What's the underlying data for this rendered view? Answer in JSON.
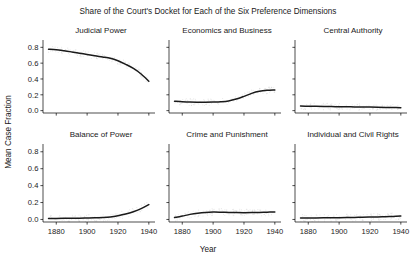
{
  "chart_data": {
    "type": "line",
    "title": "Share of the Court's Docket for Each of the Six Preference Dimensions",
    "xlabel": "Year",
    "ylabel": "Mean Case Fraction",
    "xlim": [
      1874,
      1944
    ],
    "ylim": [
      -0.03,
      0.88
    ],
    "xticks": [
      1880,
      1900,
      1920,
      1940
    ],
    "xticklabels": [
      "1880",
      "1900",
      "1920",
      "1940"
    ],
    "yticks": [
      0.0,
      0.2,
      0.4,
      0.6,
      0.8
    ],
    "yticklabels": [
      "0.0",
      "0.2",
      "0.4",
      "0.6",
      "0.8"
    ],
    "grid": false,
    "legend": "none",
    "layout": "2 rows x 3 columns of small-multiple panels",
    "line_color": "#1a1a1a",
    "point_color": "#cfcfcf",
    "x": [
      1875,
      1880,
      1885,
      1890,
      1895,
      1900,
      1905,
      1910,
      1915,
      1920,
      1925,
      1930,
      1935,
      1940
    ],
    "panels": [
      {
        "title": "Judicial Power",
        "row": 0,
        "col": 0,
        "values": [
          0.775,
          0.77,
          0.757,
          0.742,
          0.726,
          0.71,
          0.693,
          0.678,
          0.662,
          0.63,
          0.585,
          0.533,
          0.463,
          0.372
        ]
      },
      {
        "title": "Economics and Business",
        "row": 0,
        "col": 1,
        "values": [
          0.118,
          0.112,
          0.108,
          0.107,
          0.107,
          0.109,
          0.113,
          0.123,
          0.146,
          0.18,
          0.218,
          0.244,
          0.256,
          0.26
        ]
      },
      {
        "title": "Central Authority",
        "row": 0,
        "col": 2,
        "values": [
          0.057,
          0.055,
          0.054,
          0.052,
          0.051,
          0.05,
          0.049,
          0.047,
          0.046,
          0.045,
          0.043,
          0.041,
          0.039,
          0.036
        ]
      },
      {
        "title": "Balance of Power",
        "row": 1,
        "col": 0,
        "values": [
          0.011,
          0.012,
          0.013,
          0.014,
          0.015,
          0.017,
          0.019,
          0.023,
          0.03,
          0.044,
          0.064,
          0.092,
          0.128,
          0.176
        ]
      },
      {
        "title": "Crime and Punishment",
        "row": 1,
        "col": 1,
        "values": [
          0.022,
          0.04,
          0.06,
          0.074,
          0.083,
          0.087,
          0.086,
          0.083,
          0.081,
          0.08,
          0.081,
          0.083,
          0.086,
          0.088
        ]
      },
      {
        "title": "Individual and Civil Rights",
        "row": 1,
        "col": 2,
        "values": [
          0.016,
          0.017,
          0.018,
          0.019,
          0.02,
          0.021,
          0.023,
          0.024,
          0.026,
          0.028,
          0.03,
          0.033,
          0.036,
          0.04
        ]
      }
    ],
    "scatter_note": "faint light-gray observation points surround each fitted curve"
  }
}
